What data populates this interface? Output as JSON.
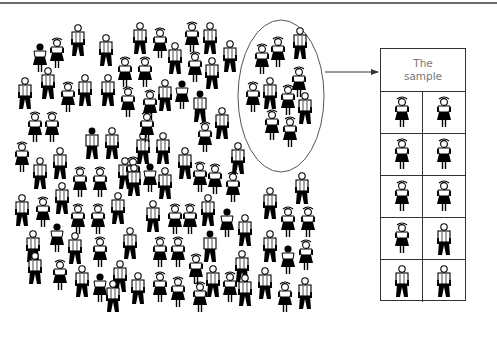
{
  "diagram": {
    "sample_box": {
      "header_line1": "The",
      "header_line2": "sample",
      "cells": [
        "girl",
        "girl",
        "girl",
        "girl",
        "girl",
        "girl",
        "girl",
        "boy",
        "boy",
        "boy"
      ]
    },
    "selection_ellipse": {
      "label": "selected group",
      "members": [
        {
          "type": "boy",
          "x": 300,
          "y": 45
        },
        {
          "type": "girl",
          "x": 262,
          "y": 62
        },
        {
          "type": "girl",
          "x": 278,
          "y": 55
        },
        {
          "type": "girl",
          "x": 299,
          "y": 85
        },
        {
          "type": "girl",
          "x": 253,
          "y": 100
        },
        {
          "type": "boy",
          "x": 270,
          "y": 95
        },
        {
          "type": "girl",
          "x": 288,
          "y": 103
        },
        {
          "type": "boy",
          "x": 305,
          "y": 110
        },
        {
          "type": "girl",
          "x": 272,
          "y": 128
        },
        {
          "type": "girl",
          "x": 290,
          "y": 135
        }
      ]
    },
    "population": [
      {
        "type": "girl",
        "x": 40,
        "y": 60,
        "hair": true
      },
      {
        "type": "girl",
        "x": 57,
        "y": 56
      },
      {
        "type": "boy",
        "x": 78,
        "y": 42
      },
      {
        "type": "boy",
        "x": 106,
        "y": 52
      },
      {
        "type": "boy",
        "x": 140,
        "y": 40
      },
      {
        "type": "girl",
        "x": 160,
        "y": 46
      },
      {
        "type": "girl",
        "x": 192,
        "y": 40
      },
      {
        "type": "boy",
        "x": 210,
        "y": 40
      },
      {
        "type": "boy",
        "x": 230,
        "y": 58
      },
      {
        "type": "boy",
        "x": 25,
        "y": 95
      },
      {
        "type": "boy",
        "x": 48,
        "y": 85
      },
      {
        "type": "girl",
        "x": 68,
        "y": 100
      },
      {
        "type": "boy",
        "x": 85,
        "y": 92
      },
      {
        "type": "boy",
        "x": 108,
        "y": 92
      },
      {
        "type": "girl",
        "x": 125,
        "y": 75
      },
      {
        "type": "girl",
        "x": 145,
        "y": 75
      },
      {
        "type": "boy",
        "x": 175,
        "y": 60
      },
      {
        "type": "girl",
        "x": 195,
        "y": 70
      },
      {
        "type": "boy",
        "x": 212,
        "y": 75
      },
      {
        "type": "boy",
        "x": 165,
        "y": 97
      },
      {
        "type": "girl",
        "x": 182,
        "y": 97,
        "hair": true
      },
      {
        "type": "boy",
        "x": 200,
        "y": 108,
        "hair": true
      },
      {
        "type": "girl",
        "x": 128,
        "y": 105
      },
      {
        "type": "girl",
        "x": 150,
        "y": 108
      },
      {
        "type": "boy",
        "x": 222,
        "y": 125
      },
      {
        "type": "girl",
        "x": 35,
        "y": 130
      },
      {
        "type": "girl",
        "x": 52,
        "y": 130
      },
      {
        "type": "boy",
        "x": 92,
        "y": 145,
        "hair": true
      },
      {
        "type": "boy",
        "x": 112,
        "y": 145
      },
      {
        "type": "boy",
        "x": 143,
        "y": 150
      },
      {
        "type": "girl",
        "x": 147,
        "y": 130
      },
      {
        "type": "boy",
        "x": 163,
        "y": 150
      },
      {
        "type": "girl",
        "x": 205,
        "y": 140
      },
      {
        "type": "girl",
        "x": 22,
        "y": 160
      },
      {
        "type": "boy",
        "x": 40,
        "y": 175
      },
      {
        "type": "boy",
        "x": 60,
        "y": 165
      },
      {
        "type": "girl",
        "x": 80,
        "y": 185
      },
      {
        "type": "girl",
        "x": 100,
        "y": 185
      },
      {
        "type": "boy",
        "x": 125,
        "y": 175
      },
      {
        "type": "girl",
        "x": 133,
        "y": 175
      },
      {
        "type": "boy",
        "x": 134,
        "y": 182
      },
      {
        "type": "girl",
        "x": 150,
        "y": 180,
        "hair": true
      },
      {
        "type": "boy",
        "x": 165,
        "y": 185
      },
      {
        "type": "boy",
        "x": 185,
        "y": 165
      },
      {
        "type": "girl",
        "x": 200,
        "y": 180
      },
      {
        "type": "girl",
        "x": 215,
        "y": 182
      },
      {
        "type": "boy",
        "x": 238,
        "y": 160
      },
      {
        "type": "girl",
        "x": 233,
        "y": 190
      },
      {
        "type": "boy",
        "x": 22,
        "y": 212
      },
      {
        "type": "girl",
        "x": 43,
        "y": 215
      },
      {
        "type": "boy",
        "x": 62,
        "y": 200
      },
      {
        "type": "girl",
        "x": 78,
        "y": 222
      },
      {
        "type": "girl",
        "x": 98,
        "y": 222
      },
      {
        "type": "boy",
        "x": 118,
        "y": 210
      },
      {
        "type": "boy",
        "x": 153,
        "y": 218
      },
      {
        "type": "girl",
        "x": 175,
        "y": 222
      },
      {
        "type": "girl",
        "x": 190,
        "y": 222
      },
      {
        "type": "boy",
        "x": 208,
        "y": 212
      },
      {
        "type": "girl",
        "x": 227,
        "y": 225,
        "hair": true
      },
      {
        "type": "boy",
        "x": 245,
        "y": 232
      },
      {
        "type": "boy",
        "x": 270,
        "y": 205
      },
      {
        "type": "boy",
        "x": 302,
        "y": 190
      },
      {
        "type": "girl",
        "x": 288,
        "y": 225
      },
      {
        "type": "girl",
        "x": 308,
        "y": 225
      },
      {
        "type": "girl",
        "x": 57,
        "y": 240,
        "hair": true
      },
      {
        "type": "boy",
        "x": 33,
        "y": 248
      },
      {
        "type": "boy",
        "x": 75,
        "y": 250
      },
      {
        "type": "girl",
        "x": 100,
        "y": 255
      },
      {
        "type": "boy",
        "x": 130,
        "y": 245
      },
      {
        "type": "girl",
        "x": 160,
        "y": 255
      },
      {
        "type": "girl",
        "x": 178,
        "y": 255
      },
      {
        "type": "girl",
        "x": 196,
        "y": 272
      },
      {
        "type": "boy",
        "x": 210,
        "y": 248,
        "hair": true
      },
      {
        "type": "boy",
        "x": 242,
        "y": 268
      },
      {
        "type": "boy",
        "x": 270,
        "y": 248
      },
      {
        "type": "girl",
        "x": 288,
        "y": 262,
        "hair": true
      },
      {
        "type": "girl",
        "x": 306,
        "y": 258
      },
      {
        "type": "boy",
        "x": 35,
        "y": 270
      },
      {
        "type": "girl",
        "x": 60,
        "y": 278
      },
      {
        "type": "boy",
        "x": 82,
        "y": 283
      },
      {
        "type": "girl",
        "x": 100,
        "y": 290,
        "hair": true
      },
      {
        "type": "boy",
        "x": 120,
        "y": 278
      },
      {
        "type": "boy",
        "x": 138,
        "y": 290
      },
      {
        "type": "girl",
        "x": 160,
        "y": 290
      },
      {
        "type": "girl",
        "x": 178,
        "y": 295
      },
      {
        "type": "boy",
        "x": 213,
        "y": 283
      },
      {
        "type": "girl",
        "x": 230,
        "y": 290
      },
      {
        "type": "boy",
        "x": 245,
        "y": 292
      },
      {
        "type": "boy",
        "x": 265,
        "y": 285
      },
      {
        "type": "girl",
        "x": 285,
        "y": 300
      },
      {
        "type": "boy",
        "x": 305,
        "y": 295
      },
      {
        "type": "boy",
        "x": 113,
        "y": 298
      },
      {
        "type": "girl",
        "x": 200,
        "y": 300
      }
    ]
  }
}
